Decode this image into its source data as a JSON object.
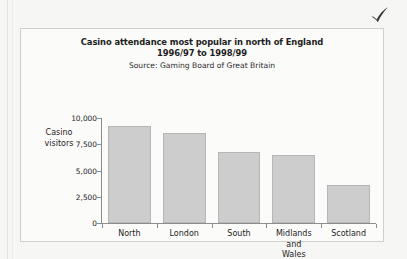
{
  "page": {
    "background_color": "#f6f6f4",
    "check_icon": "check-mark-icon",
    "check_color": "#3a3a3a"
  },
  "figure": {
    "border_color": "#cfcfcc",
    "background_color": "#fbfbfa"
  },
  "chart_data": {
    "type": "bar",
    "title": "Casino attendance most popular in north of England",
    "title_line2": "1996/97 to 1998/99",
    "subtitle": "Source: Gaming Board of Great Britain",
    "xlabel": "",
    "ylabel": "Casino",
    "ylabel_line2": "visitors",
    "categories": [
      "North",
      "London",
      "South",
      "Midlands\nand\nWales",
      "Scotland"
    ],
    "category_lines": [
      [
        "North"
      ],
      [
        "London"
      ],
      [
        "South"
      ],
      [
        "Midlands",
        "and",
        "Wales"
      ],
      [
        "Scotland"
      ]
    ],
    "values": [
      9250,
      8550,
      6800,
      6450,
      3600
    ],
    "ylim": [
      0,
      10000
    ],
    "yticks": [
      0,
      2500,
      5000,
      7500,
      10000
    ],
    "ytick_labels": [
      "0",
      "2,500",
      "5,000",
      "7,500",
      "10,000"
    ],
    "grid": false,
    "legend": null,
    "bar_color": "#cdcdcd",
    "bar_border_color": "#b6b6b6"
  }
}
